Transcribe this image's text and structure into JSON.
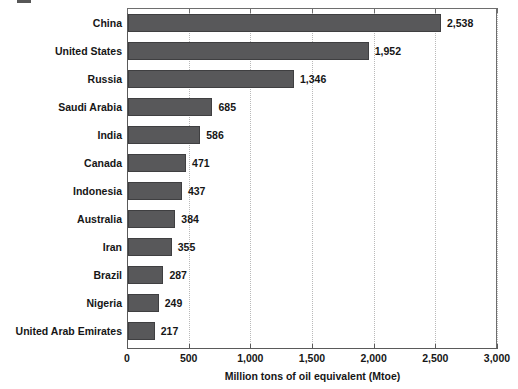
{
  "chart_data": {
    "type": "bar",
    "orientation": "horizontal",
    "title": "",
    "subtitle": "",
    "xlabel": "Million tons of oil equivalent (Mtoe)",
    "ylabel": "",
    "xlim": [
      0,
      3000
    ],
    "xticks": [
      0,
      500,
      1000,
      1500,
      2000,
      2500,
      3000
    ],
    "xtick_labels": [
      "0",
      "500",
      "1,000",
      "1,500",
      "2,000",
      "2,500",
      "3,000"
    ],
    "grid": true,
    "grid_axis": "x",
    "grid_style": "dotted",
    "legend": null,
    "categories": [
      "China",
      "United States",
      "Russia",
      "Saudi Arabia",
      "India",
      "Canada",
      "Indonesia",
      "Australia",
      "Iran",
      "Brazil",
      "Nigeria",
      "United Arab Emirates"
    ],
    "values": [
      2538,
      1952,
      1346,
      685,
      586,
      471,
      437,
      384,
      355,
      287,
      249,
      217
    ],
    "value_labels": [
      "2,538",
      "1,952",
      "1,346",
      "685",
      "586",
      "471",
      "437",
      "384",
      "355",
      "287",
      "249",
      "217"
    ],
    "series": [
      {
        "name": "Primary energy production",
        "values": [
          2538,
          1952,
          1346,
          685,
          586,
          471,
          437,
          384,
          355,
          287,
          249,
          217
        ]
      }
    ],
    "colors": {
      "bar_fill": "#58585a",
      "bar_stroke": "#3f3f41",
      "gridline": "#b9b9b9",
      "axis": "#5a5a5a",
      "text": "#161616",
      "background": "#ffffff"
    }
  }
}
